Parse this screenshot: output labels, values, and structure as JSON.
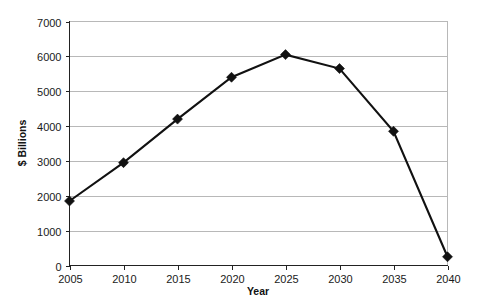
{
  "chart_data": {
    "type": "line",
    "title": "",
    "xlabel": "Year",
    "ylabel": "$ Billions",
    "x": [
      2005,
      2010,
      2015,
      2020,
      2025,
      2030,
      2035,
      2040
    ],
    "categories": [
      "2005",
      "2010",
      "2015",
      "2020",
      "2025",
      "2030",
      "2035",
      "2040"
    ],
    "values": [
      1850,
      2950,
      4200,
      5400,
      6050,
      5650,
      3850,
      250
    ],
    "series": [
      {
        "name": "$ Billions",
        "values": [
          1850,
          2950,
          4200,
          5400,
          6050,
          5650,
          3850,
          250
        ]
      }
    ],
    "xlim": [
      2005,
      2040
    ],
    "ylim": [
      0,
      7000
    ],
    "ytick_labels": [
      "0",
      "1000",
      "2000",
      "3000",
      "4000",
      "5000",
      "6000",
      "7000"
    ],
    "ytick_values": [
      0,
      1000,
      2000,
      3000,
      4000,
      5000,
      6000,
      7000
    ],
    "xtick_labels": [
      "2005",
      "2010",
      "2015",
      "2020",
      "2025",
      "2030",
      "2035",
      "2040"
    ],
    "grid": "horizontal",
    "legend": "none",
    "marker": "diamond",
    "line_color": "#111111",
    "grid_color": "#b8b8b8",
    "axis_color": "#222222",
    "background": "#ffffff"
  }
}
